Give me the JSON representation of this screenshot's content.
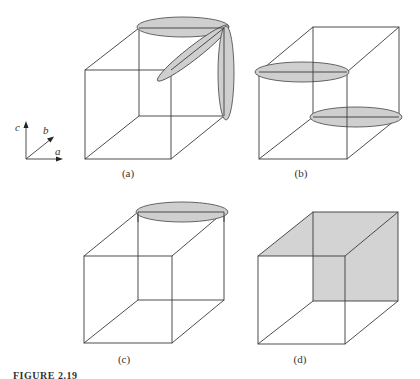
{
  "figure": {
    "caption": "FIGURE 2.19",
    "axes": {
      "c": "c",
      "b": "b",
      "a": "a"
    },
    "panels": [
      {
        "id": "a",
        "label": "(a)",
        "description": "Cube with three ellipsoids along the a, b and c directions from a corner"
      },
      {
        "id": "b",
        "label": "(b)",
        "description": "Cube with two horizontal ellipsoids at body-diagonal corners"
      },
      {
        "id": "c",
        "label": "(c)",
        "description": "Cube with a single ellipsoid along a at the top back edge"
      },
      {
        "id": "d",
        "label": "(d)",
        "description": "Cube with shaded top and back faces"
      }
    ],
    "colors": {
      "shade": "#d3d3d3",
      "line": "#3a3a3a"
    }
  }
}
